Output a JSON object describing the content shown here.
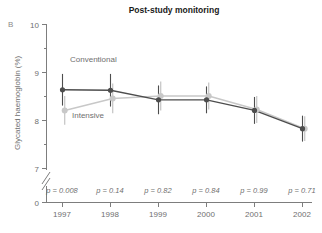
{
  "panel_label": "B",
  "chart_data": {
    "type": "line",
    "title": "Post-study monitoring",
    "xlabel": "",
    "ylabel": "Glycated haemoglobin (%)",
    "categories": [
      "1997",
      "1998",
      "1999",
      "2000",
      "2001",
      "2002"
    ],
    "x_tick_labels": [
      "1997",
      "1998",
      "1999",
      "2000",
      "2001",
      "2002"
    ],
    "y_tick_labels": [
      "0",
      "7",
      "8",
      "9",
      "10"
    ],
    "y_major_ticks": [
      7,
      8,
      9,
      10
    ],
    "y_minor_ticks": [
      7.5,
      8.5,
      9.5
    ],
    "ylim": [
      7,
      10
    ],
    "y_axis_break": true,
    "y_axis_break_label": "0",
    "grid": false,
    "legend_position": "inline-annotation",
    "series": [
      {
        "name": "Conventional",
        "color": "#4d4d4d",
        "marker": "circle",
        "values": [
          8.63,
          8.62,
          8.42,
          8.42,
          8.2,
          7.82
        ],
        "error_low": [
          8.3,
          8.28,
          8.12,
          8.14,
          7.92,
          7.55
        ],
        "error_high": [
          8.96,
          8.96,
          8.72,
          8.7,
          8.48,
          8.09
        ]
      },
      {
        "name": "Intensive",
        "color": "#c8c8c8",
        "marker": "circle",
        "values": [
          8.2,
          8.45,
          8.5,
          8.5,
          8.22,
          7.82
        ],
        "error_low": [
          7.9,
          8.14,
          8.2,
          8.22,
          7.94,
          7.56
        ],
        "error_high": [
          8.5,
          8.76,
          8.8,
          8.78,
          8.5,
          8.08
        ]
      }
    ],
    "annotations": [
      {
        "text": "Conventional",
        "x": "1997-1998",
        "y": 9.05
      },
      {
        "text": "Intensive",
        "x": "1997-1998",
        "y": 7.93
      }
    ],
    "p_values": [
      "p = 0.008",
      "p = 0.14",
      "p = 0.82",
      "p = 0.84",
      "p = 0.99",
      "p = 0.71"
    ]
  }
}
